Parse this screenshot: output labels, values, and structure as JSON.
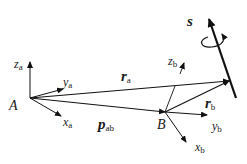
{
  "diagram": {
    "frames": {
      "a": {
        "origin_label": "A",
        "axes": [
          {
            "name": "z",
            "sub": "a"
          },
          {
            "name": "y",
            "sub": "a"
          },
          {
            "name": "x",
            "sub": "a"
          }
        ]
      },
      "b": {
        "origin_label": "B",
        "axes": [
          {
            "name": "z",
            "sub": "b"
          },
          {
            "name": "y",
            "sub": "b"
          },
          {
            "name": "x",
            "sub": "b"
          }
        ]
      }
    },
    "vectors": {
      "r_a": {
        "name": "r",
        "sub": "a"
      },
      "r_b": {
        "name": "r",
        "sub": "b"
      },
      "p_ab": {
        "name": "p",
        "sub": "ab"
      }
    },
    "screw_axis": {
      "label": "s"
    },
    "colors": {
      "stroke": "#111111",
      "text": "#1a1a1a",
      "background": "#ffffff"
    }
  }
}
